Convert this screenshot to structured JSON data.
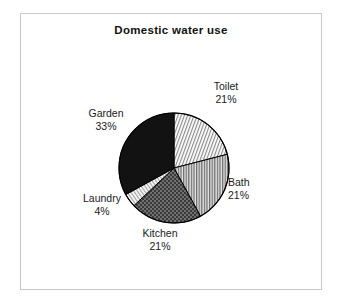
{
  "frame": {
    "border_color": "#c8c8c8",
    "background": "#ffffff"
  },
  "chart_data": {
    "type": "pie",
    "title": "Domestic water use",
    "xlabel": "",
    "ylabel": "",
    "legend_position": "none",
    "labels_position": "outside",
    "grid": false,
    "categories": [
      "Toilet",
      "Bath",
      "Kitchen",
      "Laundry",
      "Garden"
    ],
    "values": [
      21,
      21,
      21,
      4,
      33
    ],
    "unit": "%",
    "start_angle_deg": 90,
    "direction": "clockwise",
    "slices": [
      {
        "name": "Toilet",
        "value": 21,
        "value_label": "21%",
        "fill": "light-diagonal-hatch",
        "color": "#d9d9d9",
        "stroke": "#000000"
      },
      {
        "name": "Bath",
        "value": 21,
        "value_label": "21%",
        "fill": "vertical-lines",
        "color": "#a6a6a6",
        "stroke": "#000000"
      },
      {
        "name": "Kitchen",
        "value": 21,
        "value_label": "21%",
        "fill": "dark-checkerboard",
        "color": "#4d4d4d",
        "stroke": "#000000"
      },
      {
        "name": "Laundry",
        "value": 4,
        "value_label": "4%",
        "fill": "light-fine-dots",
        "color": "#e6e6e6",
        "stroke": "#000000"
      },
      {
        "name": "Garden",
        "value": 33,
        "value_label": "33%",
        "fill": "solid",
        "color": "#111111",
        "stroke": "#000000"
      }
    ]
  },
  "labels": {
    "toilet": {
      "name": "Toilet",
      "pct": "21%"
    },
    "bath": {
      "name": "Bath",
      "pct": "21%"
    },
    "kitchen": {
      "name": "Kitchen",
      "pct": "21%"
    },
    "laundry": {
      "name": "Laundry",
      "pct": "4%"
    },
    "garden": {
      "name": "Garden",
      "pct": "33%"
    }
  }
}
